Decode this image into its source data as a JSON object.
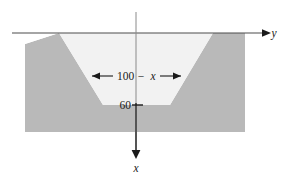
{
  "figure": {
    "background_color": "#ffffff",
    "ground_color": "#b9b9b9",
    "channel_color": "#f2f2f2",
    "line_color": "#1a1a1a",
    "axis_color": "#4d4d4d"
  },
  "axes": {
    "horizontal": {
      "label": "y",
      "name": "y-axis",
      "arrow_direction": "right"
    },
    "vertical": {
      "label": "x",
      "name": "x-axis",
      "arrow_direction": "down"
    }
  },
  "dimensions": {
    "width_label": {
      "number": "100",
      "operator": "−",
      "variable": "x",
      "full": "100 − x",
      "arrows": "double"
    },
    "depth_label": {
      "value": "60",
      "tick": true
    }
  },
  "geometry": {
    "ground_top_y": 33,
    "ground_bottom_y": 132,
    "ground_left_x": 25,
    "ground_right_x": 245,
    "channel_top_left_x": 59,
    "channel_top_right_x": 213,
    "channel_bottom_left_x": 103,
    "channel_bottom_right_x": 170,
    "channel_bottom_y": 105,
    "origin_x": 136,
    "notch_left_x": 25,
    "notch_peak_x": 59,
    "notch_top_y": 44
  }
}
